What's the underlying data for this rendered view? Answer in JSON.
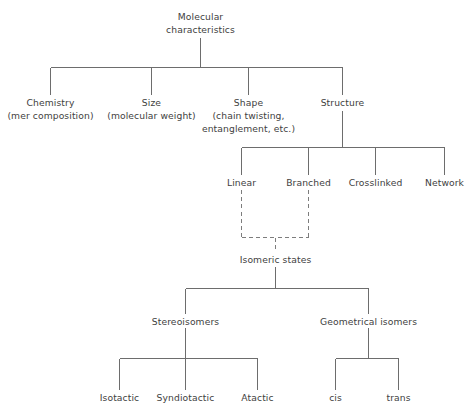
{
  "diagram": {
    "line_color": "#6d6d6d",
    "dashed_line_color": "#7d7d7d",
    "text_color": "#414141",
    "background_color": "#ffffff"
  },
  "nodes": {
    "root": {
      "line1": "Molecular",
      "line2": "characteristics"
    },
    "level2": [
      {
        "line1": "Chemistry",
        "line2": "(mer composition)",
        "line3": ""
      },
      {
        "line1": "Size",
        "line2": "(molecular weight)",
        "line3": ""
      },
      {
        "line1": "Shape",
        "line2": "(chain twisting,",
        "line3": "entanglement, etc.)"
      },
      {
        "line1": "Structure",
        "line2": "",
        "line3": ""
      }
    ],
    "level3": [
      {
        "label": "Linear"
      },
      {
        "label": "Branched"
      },
      {
        "label": "Crosslinked"
      },
      {
        "label": "Network"
      }
    ],
    "isomeric": {
      "label": "Isomeric states"
    },
    "isomer_types": [
      {
        "label": "Stereoisomers"
      },
      {
        "label": "Geometrical isomers"
      }
    ],
    "stereoisomers": [
      {
        "label": "Isotactic"
      },
      {
        "label": "Syndiotactic"
      },
      {
        "label": "Atactic"
      }
    ],
    "geometrical_isomers": [
      {
        "label": "cis"
      },
      {
        "label": "trans"
      }
    ]
  }
}
